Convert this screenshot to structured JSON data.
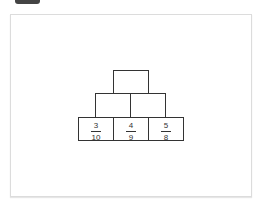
{
  "diagram": {
    "type": "number-pyramid",
    "rows": [
      {
        "cells": [
          {
            "value": ""
          }
        ]
      },
      {
        "cells": [
          {
            "value": ""
          },
          {
            "value": ""
          }
        ]
      },
      {
        "cells": [
          {
            "numerator": "3",
            "denominator": "10"
          },
          {
            "numerator": "4",
            "denominator": "9"
          },
          {
            "numerator": "5",
            "denominator": "8"
          }
        ]
      }
    ]
  },
  "colors": {
    "border": "#333333",
    "frame": "#dcdcdc",
    "tab": "#444444"
  }
}
